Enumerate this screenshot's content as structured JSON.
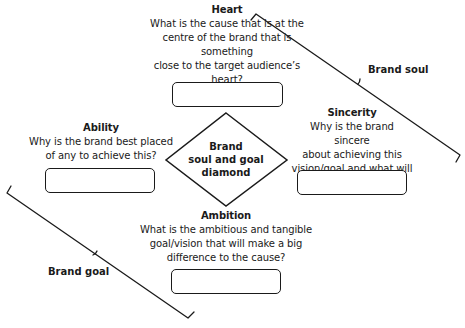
{
  "diagram": {
    "center": {
      "label": "Brand\nsoul and goal\ndiamond"
    },
    "nodes": {
      "heart": {
        "title": "Heart",
        "question": "What is the cause that is at the\ncentre of the brand that is something\nclose to the target audience’s heart?",
        "answer": ""
      },
      "sincerity": {
        "title": "Sincerity",
        "question": "Why is the brand sincere\nabout achieving this\nvision/goal and what will\nchange?",
        "answer": ""
      },
      "ability": {
        "title": "Ability",
        "question": "Why is the brand best placed\nof any to achieve this?",
        "answer": ""
      },
      "ambition": {
        "title": "Ambition",
        "question": "What is the ambitious and tangible\ngoal/vision that will make a big\ndifference to the cause?",
        "answer": ""
      }
    },
    "braces": {
      "soul": {
        "label": "Brand soul",
        "groups": [
          "Heart",
          "Sincerity"
        ]
      },
      "goal": {
        "label": "Brand goal",
        "groups": [
          "Ability",
          "Ambition"
        ]
      }
    },
    "colors": {
      "stroke": "#1a1a1a",
      "background": "#ffffff"
    }
  }
}
